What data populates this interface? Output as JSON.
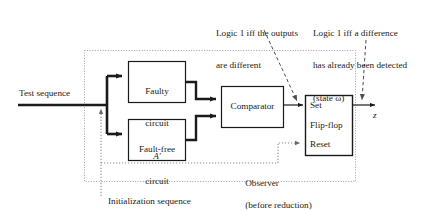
{
  "figure": {
    "kind": "block-diagram"
  },
  "annotations": {
    "comparator_note_line1": "Logic 1 iff the outputs",
    "comparator_note_line2": "are different",
    "flipflop_note_line1": "Logic 1 iff a difference",
    "flipflop_note_line2": "has already been detected",
    "flipflop_note_line3": "(state ω)"
  },
  "signals": {
    "test_sequence": "Test sequence",
    "initialization_sequence": "Initialization sequence",
    "output": "z"
  },
  "blocks": {
    "faulty": {
      "line1": "Faulty",
      "line2": "circuit",
      "line3": "A′"
    },
    "fault_free": {
      "line1": "Fault-free",
      "line2": "circuit",
      "line3": "A"
    },
    "comparator": {
      "label": "Comparator"
    },
    "flipflop": {
      "set": "Set",
      "name": "Flip-flop",
      "reset": "Reset"
    }
  },
  "boundary": {
    "caption_main": "Observer",
    "caption_paren": "(before reduction)"
  },
  "colors": {
    "line": "#1a1a1a",
    "boundary": "#9a9a9a",
    "dotted": "#8c8c8c",
    "text": "#1a1a1a",
    "background": "#ffffff"
  }
}
